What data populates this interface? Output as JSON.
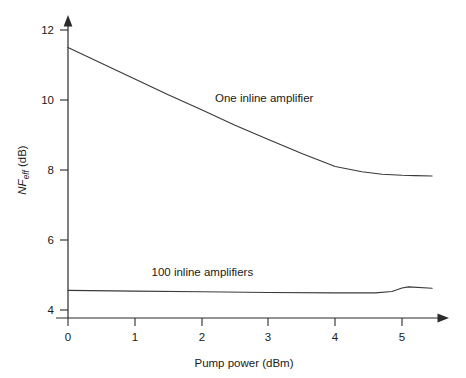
{
  "chart_data": {
    "type": "line",
    "title": "",
    "xlabel": "Pump power (dBm)",
    "ylabel": "NF_eff (dB)",
    "ylabel_parts": {
      "main": "NF",
      "sub": "eff",
      "unit": " (dB)"
    },
    "xlim": [
      0,
      5.45
    ],
    "ylim": [
      3.6,
      12.35
    ],
    "xticks": [
      0,
      1,
      2,
      3,
      4,
      5
    ],
    "xtick_labels": [
      "0",
      "1",
      "2",
      "3",
      "4",
      "5"
    ],
    "yticks": [
      4,
      6,
      8,
      10,
      12
    ],
    "ytick_labels": [
      "4",
      "6",
      "8",
      "10",
      "12"
    ],
    "grid": false,
    "legend": "inline-annotations",
    "series": [
      {
        "name": "One inline amplifier",
        "label": "One inline amplifier",
        "label_x": 2.2,
        "label_y": 9.95,
        "x": [
          0.0,
          0.5,
          1.0,
          1.5,
          2.0,
          2.5,
          3.0,
          3.5,
          4.0,
          4.4,
          4.7,
          5.0,
          5.2,
          5.45
        ],
        "values": [
          11.5,
          11.05,
          10.6,
          10.15,
          9.72,
          9.28,
          8.87,
          8.47,
          8.1,
          7.95,
          7.88,
          7.85,
          7.84,
          7.83
        ]
      },
      {
        "name": "100 inline amplifiers",
        "label": "100 inline amplifiers",
        "label_x": 1.25,
        "label_y": 4.98,
        "x": [
          0.0,
          1.0,
          2.0,
          3.0,
          4.0,
          4.6,
          4.85,
          5.0,
          5.1,
          5.45
        ],
        "values": [
          4.56,
          4.54,
          4.52,
          4.5,
          4.49,
          4.49,
          4.53,
          4.63,
          4.66,
          4.62
        ]
      }
    ],
    "colors": {
      "axis": "#2b2b2b",
      "curve": "#3a3a3a",
      "text": "#1a1a1a",
      "background": "#ffffff"
    }
  }
}
